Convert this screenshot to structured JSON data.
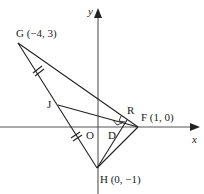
{
  "diagram": {
    "axes": {
      "x_label": "x",
      "y_label": "y"
    },
    "points": {
      "G": {
        "label": "G (−4, 3)"
      },
      "F": {
        "label": "F (1, 0)"
      },
      "H": {
        "label": "H (0, −1)"
      },
      "J": {
        "label": "J"
      },
      "R": {
        "label": "R"
      },
      "D": {
        "label": "D"
      },
      "O": {
        "label": "O"
      }
    },
    "line_color": "#222222"
  }
}
